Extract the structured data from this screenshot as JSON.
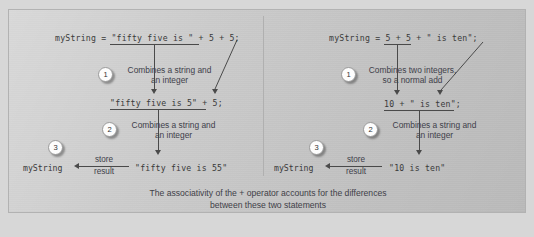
{
  "figure": {
    "caption": "The associativity of the + operator accounts for the differences\nbetween these two statements"
  },
  "left": {
    "statement": "myString = \"fifty five is \" + 5 + 5;",
    "step1_number": "1",
    "step1_note": "Combines a string and\nan integer",
    "intermediate": "\"fifty five is 5\" + 5;",
    "step2_number": "2",
    "step2_note": "Combines a string and\nan integer",
    "step3_number": "3",
    "result_variable": "myString",
    "store_label_top": "store",
    "store_label_bottom": "result",
    "result_value": "\"fifty five is 55\""
  },
  "right": {
    "statement": "myString = 5 + 5 + \" is ten\";",
    "step1_number": "1",
    "step1_note": "Combines two integers,\nso a normal add",
    "intermediate": "10 + \" is ten\";",
    "step2_number": "2",
    "step2_note": "Combines a string and\nan integer",
    "step3_number": "3",
    "result_variable": "myString",
    "store_label_top": "store",
    "store_label_bottom": "result",
    "result_value": "\"10 is ten\""
  },
  "colors": {
    "panel_background": "#c9c9c9",
    "page_background": "#d7d7d7",
    "line": "#4a4a4a",
    "code_text": "#3a3a3a",
    "note_text": "#40404a"
  }
}
